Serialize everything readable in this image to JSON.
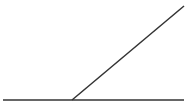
{
  "diagram": {
    "type": "angle",
    "background": "#ffffff",
    "stroke_color": "#333333",
    "stroke_width": 1.5,
    "baseline": {
      "x1": 3,
      "y1": 100,
      "x2": 184,
      "y2": 100
    },
    "ray": {
      "x1": 72,
      "y1": 100,
      "x2": 184,
      "y2": 6
    },
    "vertex": {
      "x": 72,
      "y": 100
    }
  }
}
